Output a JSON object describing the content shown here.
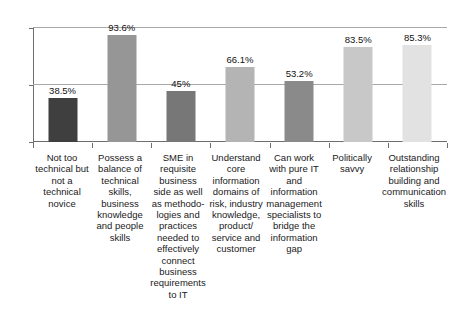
{
  "chart_data": {
    "type": "bar",
    "title": "",
    "xlabel": "",
    "ylabel": "",
    "ylim": [
      0,
      100
    ],
    "yticks": [
      0,
      50,
      100
    ],
    "grid": true,
    "legend": false,
    "categories": [
      "Not too technical but not a technical novice",
      "Possess a balance of technical skills, business knowledge and people skills",
      "SME in requisite business side as well as methodo-logies and practices needed to effectively connect business requirements to IT",
      "Understand core information domains of risk, industry knowledge, product/ service and customer",
      "Can work with pure IT and information management specialists to bridge the information gap",
      "Politically savvy",
      "Outstanding relationship building and communication skills"
    ],
    "values": [
      38.5,
      93.6,
      45,
      66.1,
      53.2,
      83.5,
      85.3
    ],
    "value_labels": [
      "38.5%",
      "93.6%",
      "45%",
      "66.1%",
      "53.2%",
      "83.5%",
      "85.3%"
    ],
    "bar_colors": [
      "#3f3f3f",
      "#969696",
      "#777777",
      "#b4b4b4",
      "#8a8a8a",
      "#c8c8c8",
      "#e2e2e2"
    ]
  },
  "axis": {
    "y_tick_labels": [
      "100",
      "50",
      "0"
    ],
    "axis_color": "#6e6e6e",
    "grid_color": "#a9a9a9"
  }
}
